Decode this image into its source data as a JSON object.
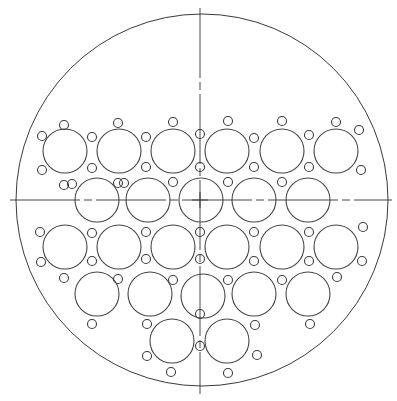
{
  "drawing": {
    "title": "Tube sheet / perforated plate layout",
    "colors": {
      "background": "#ffffff",
      "line": "#3a3a3a"
    },
    "outer_circle": {
      "cx": 202,
      "cy": 200,
      "r": 186
    },
    "centerlines": {
      "vertical": {
        "x": 200,
        "y1": 8,
        "y2": 394,
        "dash": "70 4 8 4"
      },
      "horizontal": {
        "y": 200,
        "x1": 10,
        "x2": 392,
        "dash": "70 4 8 4"
      },
      "center_cross": {
        "x": 200,
        "y": 200,
        "size": 8
      }
    },
    "large_hole_radius": 22,
    "small_hole_radius": 4.5,
    "large_holes": [
      {
        "row": 1,
        "cx": 65,
        "cy": 151
      },
      {
        "row": 1,
        "cx": 119,
        "cy": 151
      },
      {
        "row": 1,
        "cx": 173,
        "cy": 151
      },
      {
        "row": 1,
        "cx": 227,
        "cy": 151
      },
      {
        "row": 1,
        "cx": 282,
        "cy": 151
      },
      {
        "row": 1,
        "cx": 336,
        "cy": 151
      },
      {
        "row": 2,
        "cx": 97,
        "cy": 200
      },
      {
        "row": 2,
        "cx": 148,
        "cy": 200
      },
      {
        "row": 2,
        "cx": 201,
        "cy": 200
      },
      {
        "row": 2,
        "cx": 254,
        "cy": 200
      },
      {
        "row": 2,
        "cx": 308,
        "cy": 200
      },
      {
        "row": 3,
        "cx": 65,
        "cy": 247
      },
      {
        "row": 3,
        "cx": 119,
        "cy": 247
      },
      {
        "row": 3,
        "cx": 173,
        "cy": 247
      },
      {
        "row": 3,
        "cx": 227,
        "cy": 247
      },
      {
        "row": 3,
        "cx": 282,
        "cy": 247
      },
      {
        "row": 3,
        "cx": 336,
        "cy": 247
      },
      {
        "row": 4,
        "cx": 97,
        "cy": 294
      },
      {
        "row": 4,
        "cx": 150,
        "cy": 294
      },
      {
        "row": 4,
        "cx": 203,
        "cy": 296
      },
      {
        "row": 4,
        "cx": 254,
        "cy": 294
      },
      {
        "row": 4,
        "cx": 308,
        "cy": 294
      },
      {
        "row": 5,
        "cx": 172,
        "cy": 341
      },
      {
        "row": 5,
        "cx": 227,
        "cy": 341
      }
    ],
    "small_holes": [
      [
        64,
        125
      ],
      [
        118,
        123
      ],
      [
        173,
        122
      ],
      [
        228,
        121
      ],
      [
        282,
        121
      ],
      [
        336,
        122
      ],
      [
        42,
        136
      ],
      [
        92,
        137
      ],
      [
        146,
        137
      ],
      [
        200,
        134
      ],
      [
        254,
        138
      ],
      [
        309,
        135
      ],
      [
        359,
        130
      ],
      [
        42,
        170
      ],
      [
        92,
        168
      ],
      [
        146,
        167
      ],
      [
        200,
        167
      ],
      [
        254,
        167
      ],
      [
        309,
        167
      ],
      [
        361,
        170
      ],
      [
        64,
        185
      ],
      [
        118,
        183
      ],
      [
        173,
        182
      ],
      [
        228,
        182
      ],
      [
        282,
        182
      ],
      [
        72,
        184
      ],
      [
        124,
        183
      ],
      [
        40,
        232
      ],
      [
        92,
        233
      ],
      [
        146,
        232
      ],
      [
        200,
        232
      ],
      [
        254,
        232
      ],
      [
        309,
        232
      ],
      [
        363,
        227
      ],
      [
        41,
        262
      ],
      [
        92,
        261
      ],
      [
        146,
        259
      ],
      [
        200,
        259
      ],
      [
        254,
        261
      ],
      [
        309,
        261
      ],
      [
        362,
        261
      ],
      [
        64,
        278
      ],
      [
        118,
        279
      ],
      [
        173,
        280
      ],
      [
        228,
        280
      ],
      [
        282,
        280
      ],
      [
        337,
        277
      ],
      [
        92,
        324
      ],
      [
        147,
        324
      ],
      [
        200,
        314
      ],
      [
        255,
        325
      ],
      [
        310,
        324
      ],
      [
        147,
        356
      ],
      [
        200,
        346
      ],
      [
        257,
        355
      ],
      [
        171,
        372
      ],
      [
        228,
        373
      ]
    ]
  }
}
